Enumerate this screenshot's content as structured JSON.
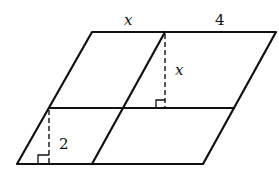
{
  "diagram": {
    "type": "parallelogram-subdivided",
    "labels": {
      "top_left_segment": "x",
      "top_right_segment": "4",
      "upper_height": "x",
      "lower_height": "2"
    },
    "colors": {
      "stroke": "#111111",
      "background": "#ffffff"
    }
  }
}
